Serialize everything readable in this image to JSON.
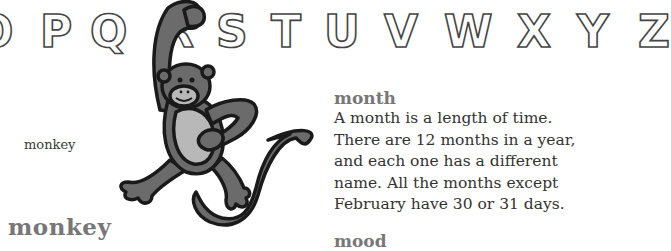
{
  "alphabet": {
    "letters": [
      "O",
      "P",
      "Q",
      "R",
      "S",
      "T",
      "U",
      "V",
      "W",
      "X",
      "Y",
      "Z"
    ]
  },
  "illustration": {
    "subject": "monkey",
    "caption": "monkey",
    "colors": {
      "body": "#6b6b6b",
      "belly": "#b8b8b8",
      "outline": "#1a1a1a"
    }
  },
  "left_entry": {
    "headword": "monkey"
  },
  "entries": [
    {
      "headword": "month",
      "definition": "A month is a length of time. There are 12 months in a year, and each one has a different name. All the months except February have 30 or 31 days.",
      "lines": [
        "A month is a length of time.",
        "There are 12 months in a year,",
        "and each one has a different",
        "name. All the months except",
        "February have 30 or 31 days."
      ]
    },
    {
      "headword": "mood"
    }
  ]
}
